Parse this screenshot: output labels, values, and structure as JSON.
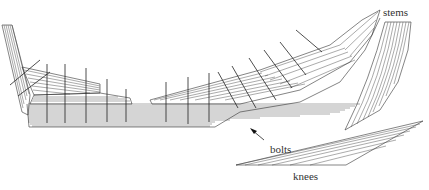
{
  "figure": {
    "labels": {
      "stems": "stems",
      "bolts": "bolts",
      "knees": "knees"
    },
    "caption": "",
    "colors": {
      "line": "#333333",
      "background": "#ffffff"
    }
  }
}
